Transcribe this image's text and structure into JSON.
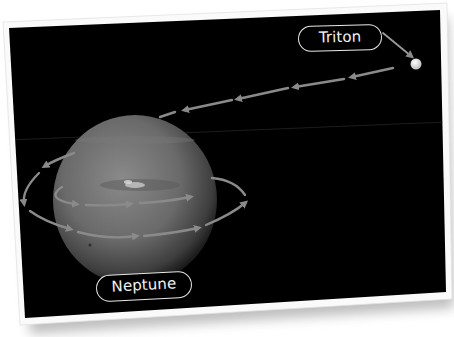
{
  "image": {
    "description": "Photo print of Neptune with Triton's retrograde orbit shown by arrows",
    "background_color": "#ffffff",
    "photo_fill": "#000000",
    "border_color": "#fafafa",
    "arrow_color": "#8a8a8a",
    "planet_color": "#6f6f6f"
  },
  "labels": {
    "moon": "Triton",
    "planet": "Neptune"
  },
  "icons": {
    "moon": "moon-dot-icon",
    "planet": "planet-sphere-icon",
    "orbit_arrows": "orbit-arrow-icon"
  }
}
